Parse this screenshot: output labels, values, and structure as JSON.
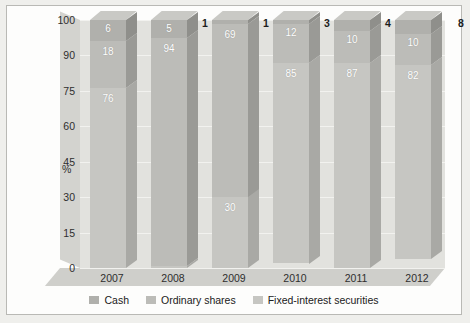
{
  "chart_data": {
    "type": "bar",
    "subtype": "stacked-100-3d",
    "title": "",
    "xlabel": "",
    "ylabel": "%",
    "categories": [
      "2007",
      "2008",
      "2009",
      "2010",
      "2011",
      "2012"
    ],
    "ytick_labels": [
      "100",
      "90",
      "75",
      "60",
      "45",
      "30",
      "15",
      "0"
    ],
    "ytick_values": [
      100,
      90,
      75,
      60,
      45,
      30,
      15,
      0
    ],
    "ylim": [
      0,
      100
    ],
    "grid": true,
    "legend_position": "bottom",
    "series": [
      {
        "name": "Cash",
        "color": "#b0b0ac",
        "values": [
          6,
          5,
          1,
          1,
          3,
          4
        ]
      },
      {
        "name": "Ordinary shares",
        "color": "#bcbcb8",
        "values": [
          18,
          94,
          69,
          12,
          10,
          10
        ]
      },
      {
        "name": "Fixed-interest securities",
        "color": "#c6c6c2",
        "values": [
          76,
          1,
          30,
          85,
          87,
          82
        ]
      }
    ],
    "labels_inside": {
      "2007": [
        "6",
        "18",
        "76"
      ],
      "2008": [
        "5",
        "94",
        ""
      ],
      "2009": [
        "",
        "69",
        "30"
      ],
      "2010": [
        "",
        "12",
        "85"
      ],
      "2011": [
        "",
        "10",
        "87"
      ],
      "2012": [
        "",
        "10",
        "82"
      ]
    },
    "labels_outside": [
      {
        "category": "2009",
        "text": "1"
      },
      {
        "category": "2010",
        "text": "1"
      },
      {
        "category": "2011",
        "text": "3"
      },
      {
        "category": "2012",
        "text": "4"
      },
      {
        "category": "",
        "text": "8"
      }
    ]
  },
  "axis": {
    "y_title": "%",
    "ticks": [
      {
        "label": "100",
        "pos": 0
      },
      {
        "label": "90",
        "pos": 1
      },
      {
        "label": "75",
        "pos": 2
      },
      {
        "label": "60",
        "pos": 3
      },
      {
        "label": "45",
        "pos": 4
      },
      {
        "label": "30",
        "pos": 5
      },
      {
        "label": "15",
        "pos": 6
      },
      {
        "label": "0",
        "pos": 7
      }
    ]
  },
  "xaxis": {
    "categories": [
      "2007",
      "2008",
      "2009",
      "2010",
      "2011",
      "2012"
    ]
  },
  "legend": {
    "items": [
      {
        "label": "Cash",
        "color": "#b0b0ac"
      },
      {
        "label": "Ordinary shares",
        "color": "#bcbcb8"
      },
      {
        "label": "Fixed-interest securities",
        "color": "#c6c6c2"
      }
    ]
  },
  "colors": {
    "cash": "#b0b0ac",
    "ordinary_shares": "#bcbcb8",
    "fixed_interest": "#c6c6c2",
    "plot_background": "#e2e2de",
    "card_background": "#fdfdfc",
    "page_background": "#e9e9e7"
  }
}
